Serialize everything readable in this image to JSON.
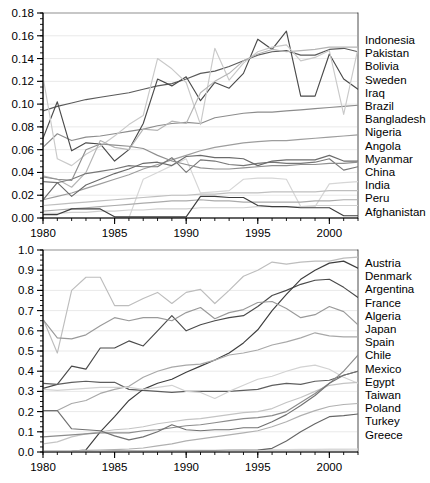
{
  "figure": {
    "title": "",
    "width": 430,
    "height": 483,
    "background": "#ffffff"
  },
  "chart_data": [
    {
      "id": "top",
      "type": "line",
      "title": "",
      "xlabel": "",
      "ylabel": "",
      "xlim": [
        1980,
        2002
      ],
      "ylim": [
        0.0,
        0.18
      ],
      "grid": true,
      "legend_position": "right",
      "x_ticks": [
        1980,
        1985,
        1990,
        1995,
        2000
      ],
      "x_tick_labels": [
        "1980",
        "1985",
        "1990",
        "1995",
        "2000"
      ],
      "x_minor_step": 1,
      "y_ticks": [
        0.0,
        0.02,
        0.04,
        0.06,
        0.08,
        0.1,
        0.12,
        0.14,
        0.16,
        0.18
      ],
      "y_tick_labels": [
        "0.00",
        "0.02",
        "0.04",
        "0.06",
        "0.08",
        "0.10",
        "0.12",
        "0.14",
        "0.16",
        "0.18"
      ],
      "y_minor_step": 0.005,
      "x": [
        1980,
        1981,
        1982,
        1983,
        1984,
        1985,
        1986,
        1987,
        1988,
        1989,
        1990,
        1991,
        1992,
        1993,
        1994,
        1995,
        1996,
        1997,
        1998,
        1999,
        2000,
        2001,
        2002
      ],
      "series": [
        {
          "name": "Indonesia",
          "color": "#5a5a5a",
          "values": [
            0.094,
            0.098,
            0.101,
            0.104,
            0.106,
            0.108,
            0.11,
            0.113,
            0.116,
            0.118,
            0.122,
            0.127,
            0.129,
            0.133,
            0.138,
            0.143,
            0.146,
            0.147,
            0.143,
            0.143,
            0.148,
            0.149,
            0.146
          ]
        },
        {
          "name": "Pakistan",
          "color": "#8c8c8c",
          "values": [
            0.062,
            0.074,
            0.068,
            0.071,
            0.072,
            0.074,
            0.076,
            0.078,
            0.081,
            0.083,
            0.084,
            0.083,
            0.088,
            0.09,
            0.092,
            0.093,
            0.093,
            0.094,
            0.095,
            0.096,
            0.097,
            0.098,
            0.099
          ]
        },
        {
          "name": "Bolivia",
          "color": "#4a4a4a",
          "values": [
            0.07,
            0.102,
            0.059,
            0.066,
            0.065,
            0.05,
            0.06,
            0.083,
            0.122,
            0.116,
            0.124,
            0.103,
            0.119,
            0.114,
            0.127,
            0.157,
            0.148,
            0.164,
            0.107,
            0.107,
            0.144,
            0.122,
            0.113
          ]
        },
        {
          "name": "Sweden",
          "color": "#c9c9c9",
          "values": [
            0.124,
            0.052,
            0.046,
            0.056,
            0.063,
            0.072,
            0.082,
            0.09,
            0.14,
            0.131,
            0.119,
            0.082,
            0.149,
            0.121,
            0.136,
            0.146,
            0.15,
            0.152,
            0.138,
            0.141,
            0.147,
            0.091,
            0.149
          ]
        },
        {
          "name": "Iraq",
          "color": "#b5b5b5",
          "values": [
            0.037,
            0.034,
            0.027,
            0.04,
            0.068,
            0.062,
            0.06,
            0.078,
            0.077,
            0.085,
            0.083,
            0.11,
            0.12,
            0.127,
            0.138,
            0.144,
            0.148,
            0.146,
            0.147,
            0.148,
            0.15,
            0.15,
            0.15
          ]
        },
        {
          "name": "Brazil",
          "color": "#9d9d9d",
          "values": [
            0.016,
            0.019,
            0.022,
            0.026,
            0.03,
            0.034,
            0.038,
            0.043,
            0.047,
            0.051,
            0.055,
            0.059,
            0.062,
            0.064,
            0.066,
            0.067,
            0.068,
            0.068,
            0.069,
            0.07,
            0.071,
            0.072,
            0.073
          ]
        },
        {
          "name": "Bangladesh",
          "color": "#d6d6d6",
          "values": [
            0.0,
            0.0,
            0.0,
            0.0,
            0.0,
            0.0,
            0.0,
            0.034,
            0.04,
            0.046,
            0.052,
            0.022,
            0.023,
            0.024,
            0.034,
            0.035,
            0.035,
            0.034,
            0.01,
            0.01,
            0.03,
            0.031,
            0.032
          ]
        },
        {
          "name": "Nigeria",
          "color": "#777777",
          "values": [
            0.032,
            0.031,
            0.034,
            0.039,
            0.041,
            0.043,
            0.046,
            0.045,
            0.045,
            0.053,
            0.04,
            0.051,
            0.05,
            0.047,
            0.046,
            0.048,
            0.049,
            0.048,
            0.048,
            0.049,
            0.052,
            0.042,
            0.045
          ]
        },
        {
          "name": "Angola",
          "color": "#6b6b6b",
          "values": [
            0.016,
            0.031,
            0.019,
            0.029,
            0.034,
            0.039,
            0.043,
            0.048,
            0.049,
            0.046,
            0.054,
            0.055,
            0.053,
            0.053,
            0.052,
            0.046,
            0.05,
            0.051,
            0.051,
            0.051,
            0.055,
            0.05,
            0.05
          ]
        },
        {
          "name": "Myanmar",
          "color": "#8f8f8f",
          "values": [
            0.036,
            0.034,
            0.033,
            0.06,
            0.065,
            0.064,
            0.063,
            0.061,
            0.055,
            0.05,
            0.047,
            0.044,
            0.043,
            0.043,
            0.044,
            0.045,
            0.046,
            0.046,
            0.047,
            0.047,
            0.048,
            0.048,
            0.049
          ]
        },
        {
          "name": "China",
          "color": "#bfbfbf",
          "values": [
            0.011,
            0.012,
            0.013,
            0.014,
            0.015,
            0.016,
            0.017,
            0.018,
            0.019,
            0.02,
            0.02,
            0.021,
            0.021,
            0.022,
            0.022,
            0.022,
            0.023,
            0.023,
            0.023,
            0.023,
            0.024,
            0.024,
            0.024
          ]
        },
        {
          "name": "India",
          "color": "#ababab",
          "values": [
            0.006,
            0.007,
            0.008,
            0.009,
            0.01,
            0.011,
            0.012,
            0.013,
            0.014,
            0.015,
            0.015,
            0.016,
            0.015,
            0.015,
            0.014,
            0.014,
            0.014,
            0.014,
            0.014,
            0.015,
            0.015,
            0.016,
            0.016
          ]
        },
        {
          "name": "Peru",
          "color": "#d0d0d0",
          "values": [
            0.004,
            0.004,
            0.005,
            0.005,
            0.006,
            0.006,
            0.007,
            0.007,
            0.008,
            0.008,
            0.008,
            0.009,
            0.009,
            0.009,
            0.009,
            0.01,
            0.01,
            0.01,
            0.01,
            0.011,
            0.011,
            0.011,
            0.011
          ]
        },
        {
          "name": "Afghanistan",
          "color": "#3d3d3d",
          "values": [
            0.003,
            0.003,
            0.008,
            0.008,
            0.008,
            0.001,
            0.001,
            0.001,
            0.001,
            0.001,
            0.001,
            0.019,
            0.019,
            0.018,
            0.018,
            0.011,
            0.01,
            0.01,
            0.009,
            0.009,
            0.009,
            0.002,
            0.002
          ]
        }
      ]
    },
    {
      "id": "bottom",
      "type": "line",
      "title": "",
      "xlabel": "",
      "ylabel": "",
      "xlim": [
        1980,
        2002
      ],
      "ylim": [
        0.0,
        1.0
      ],
      "grid": true,
      "legend_position": "right",
      "x_ticks": [
        1980,
        1985,
        1990,
        1995,
        2000
      ],
      "x_tick_labels": [
        "1980",
        "1985",
        "1990",
        "1995",
        "2000"
      ],
      "x_minor_step": 1,
      "y_ticks": [
        0.0,
        0.1,
        0.2,
        0.3,
        0.4,
        0.5,
        0.6,
        0.7,
        0.8,
        0.9,
        1.0
      ],
      "y_tick_labels": [
        "0.0",
        "0.1",
        "0.2",
        "0.3",
        "0.4",
        "0.5",
        "0.6",
        "0.7",
        "0.8",
        "0.9",
        "1.0"
      ],
      "y_minor_step": 0.025,
      "x": [
        1980,
        1981,
        1982,
        1983,
        1984,
        1985,
        1986,
        1987,
        1988,
        1989,
        1990,
        1991,
        1992,
        1993,
        1994,
        1995,
        1996,
        1997,
        1998,
        1999,
        2000,
        2001,
        2002
      ],
      "series": [
        {
          "name": "Austria",
          "color": "#4a4a4a",
          "values": [
            0.315,
            0.335,
            0.425,
            0.41,
            0.515,
            0.515,
            0.55,
            0.525,
            0.6,
            0.675,
            0.6,
            0.63,
            0.65,
            0.665,
            0.675,
            0.72,
            0.775,
            0.8,
            0.83,
            0.85,
            0.855,
            0.815,
            0.765
          ]
        },
        {
          "name": "Denmark",
          "color": "#5e5e5e",
          "values": [
            0.34,
            0.335,
            0.345,
            0.35,
            0.345,
            0.345,
            0.31,
            0.305,
            0.3,
            0.295,
            0.3,
            0.3,
            0.3,
            0.3,
            0.305,
            0.31,
            0.33,
            0.34,
            0.335,
            0.35,
            0.355,
            0.38,
            0.4
          ]
        },
        {
          "name": "Argentina",
          "color": "#bdbdbd",
          "values": [
            0.66,
            0.49,
            0.8,
            0.865,
            0.865,
            0.725,
            0.725,
            0.76,
            0.79,
            0.735,
            0.79,
            0.805,
            0.735,
            0.8,
            0.87,
            0.9,
            0.94,
            0.93,
            0.94,
            0.945,
            0.945,
            0.96,
            0.965
          ]
        },
        {
          "name": "France",
          "color": "#3d3d3d",
          "values": [
            0.003,
            0.003,
            0.004,
            0.01,
            0.1,
            0.175,
            0.255,
            0.31,
            0.34,
            0.36,
            0.395,
            0.425,
            0.455,
            0.49,
            0.54,
            0.605,
            0.7,
            0.78,
            0.855,
            0.9,
            0.935,
            0.945,
            0.91
          ]
        },
        {
          "name": "Algeria",
          "color": "#a8a8a8",
          "values": [
            0.205,
            0.205,
            0.24,
            0.255,
            0.29,
            0.31,
            0.325,
            0.37,
            0.4,
            0.42,
            0.43,
            0.435,
            0.455,
            0.48,
            0.49,
            0.505,
            0.53,
            0.545,
            0.565,
            0.59,
            0.575,
            0.57,
            0.57
          ]
        },
        {
          "name": "Japan",
          "color": "#9a9a9a",
          "values": [
            0.655,
            0.565,
            0.56,
            0.58,
            0.625,
            0.665,
            0.65,
            0.665,
            0.665,
            0.65,
            0.69,
            0.715,
            0.66,
            0.69,
            0.705,
            0.74,
            0.745,
            0.71,
            0.665,
            0.68,
            0.72,
            0.695,
            0.63
          ]
        },
        {
          "name": "Spain",
          "color": "#d2d2d2",
          "values": [
            0.31,
            0.305,
            0.31,
            0.315,
            0.32,
            0.32,
            0.32,
            0.31,
            0.32,
            0.33,
            0.3,
            0.295,
            0.265,
            0.3,
            0.33,
            0.36,
            0.375,
            0.4,
            0.42,
            0.43,
            0.41,
            0.37,
            0.34
          ]
        },
        {
          "name": "Chile",
          "color": "#c4c4c4",
          "values": [
            0.04,
            0.05,
            0.075,
            0.09,
            0.1,
            0.11,
            0.115,
            0.125,
            0.14,
            0.15,
            0.16,
            0.165,
            0.175,
            0.185,
            0.195,
            0.2,
            0.215,
            0.245,
            0.27,
            0.3,
            0.33,
            0.34,
            0.345
          ]
        },
        {
          "name": "Mexico",
          "color": "#8c8c8c",
          "values": [
            0.075,
            0.08,
            0.085,
            0.09,
            0.095,
            0.095,
            0.095,
            0.105,
            0.11,
            0.12,
            0.13,
            0.135,
            0.145,
            0.155,
            0.165,
            0.17,
            0.18,
            0.2,
            0.245,
            0.29,
            0.34,
            0.4,
            0.48
          ]
        },
        {
          "name": "Egypt",
          "color": "#717171",
          "values": [
            0.205,
            0.205,
            0.115,
            0.11,
            0.105,
            0.08,
            0.06,
            0.075,
            0.1,
            0.135,
            0.11,
            0.105,
            0.11,
            0.11,
            0.12,
            0.12,
            0.15,
            0.185,
            0.23,
            0.28,
            0.34,
            0.38,
            0.4
          ]
        },
        {
          "name": "Taiwan",
          "color": "#b0b0b0",
          "values": [
            0.005,
            0.005,
            0.005,
            0.008,
            0.01,
            0.012,
            0.015,
            0.02,
            0.03,
            0.04,
            0.055,
            0.065,
            0.075,
            0.085,
            0.095,
            0.105,
            0.125,
            0.15,
            0.18,
            0.205,
            0.225,
            0.235,
            0.24
          ]
        },
        {
          "name": "Poland",
          "color": "#dadada",
          "values": [
            0.003,
            0.003,
            0.003,
            0.004,
            0.005,
            0.006,
            0.006,
            0.007,
            0.008,
            0.008,
            0.009,
            0.009,
            0.01,
            0.01,
            0.011,
            0.011,
            0.012,
            0.012,
            0.013,
            0.013,
            0.014,
            0.014,
            0.015
          ]
        },
        {
          "name": "Turkey",
          "color": "#666666",
          "values": [
            0.002,
            0.002,
            0.002,
            0.003,
            0.003,
            0.004,
            0.004,
            0.005,
            0.005,
            0.006,
            0.006,
            0.007,
            0.007,
            0.008,
            0.008,
            0.009,
            0.018,
            0.055,
            0.1,
            0.14,
            0.175,
            0.18,
            0.188
          ]
        },
        {
          "name": "Greece",
          "color": "#cfcfcf",
          "values": [
            0.002,
            0.002,
            0.002,
            0.002,
            0.003,
            0.003,
            0.003,
            0.004,
            0.004,
            0.004,
            0.005,
            0.005,
            0.005,
            0.006,
            0.006,
            0.006,
            0.007,
            0.007,
            0.008,
            0.008,
            0.009,
            0.009,
            0.01
          ]
        }
      ]
    }
  ],
  "legends": {
    "top": {
      "items": [
        "Indonesia",
        "Pakistan",
        "Bolivia",
        "Sweden",
        "Iraq",
        "Brazil",
        "Bangladesh",
        "Nigeria",
        "Angola",
        "Myanmar",
        "China",
        "India",
        "Peru",
        "Afghanistan"
      ]
    },
    "bottom": {
      "items": [
        "Austria",
        "Denmark",
        "Argentina",
        "France",
        "Algeria",
        "Japan",
        "Spain",
        "Chile",
        "Mexico",
        "Egypt",
        "Taiwan",
        "Poland",
        "Turkey",
        "Greece"
      ]
    }
  }
}
